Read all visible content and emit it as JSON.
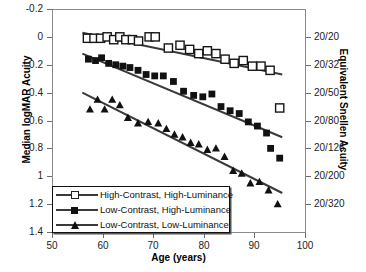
{
  "chart_data": {
    "type": "scatter",
    "title": "",
    "xlabel": "Age (years)",
    "ylabel": "Median logMAR Acuity",
    "ylabel_right": "Equivalent Snellen Acuity",
    "xlim": [
      50,
      100
    ],
    "ylim": [
      -0.2,
      1.4
    ],
    "y_inverted": true,
    "grid": false,
    "legend_position": "lower-left-inside",
    "xticks": [
      50,
      60,
      70,
      80,
      90,
      100
    ],
    "xtick_labels": [
      "50",
      "60",
      "70",
      "80",
      "90",
      "100"
    ],
    "yticks": [
      -0.2,
      0,
      0.2,
      0.4,
      0.6,
      0.8,
      1.0,
      1.2,
      1.4
    ],
    "ytick_labels": [
      "-0.2",
      "0",
      "0.2",
      "0.4",
      "0.6",
      "0.8",
      "1",
      "1.2",
      "1.4"
    ],
    "right_axis": {
      "ticks": [
        0,
        0.2,
        0.4,
        0.6,
        0.8,
        1.0,
        1.2
      ],
      "labels": [
        "20/20",
        "20/32",
        "20/50",
        "20/80",
        "20/126",
        "20/200",
        "20/320"
      ]
    },
    "series": [
      {
        "name": "High-Contrast, High-Luminance",
        "marker": "open-square",
        "color": "#111111",
        "fill": "#ffffff",
        "points": [
          [
            57.0,
            0.01
          ],
          [
            58.3,
            0.01
          ],
          [
            59.6,
            0.01
          ],
          [
            60.9,
            0.0
          ],
          [
            62.2,
            0.02
          ],
          [
            63.4,
            0.0
          ],
          [
            64.6,
            0.02
          ],
          [
            65.9,
            0.02
          ],
          [
            67.1,
            0.03
          ],
          [
            69.2,
            0.0
          ],
          [
            70.4,
            0.0
          ],
          [
            73.0,
            0.08
          ],
          [
            75.3,
            0.06
          ],
          [
            77.2,
            0.09
          ],
          [
            79.0,
            0.12
          ],
          [
            80.7,
            0.1
          ],
          [
            82.4,
            0.12
          ],
          [
            84.2,
            0.16
          ],
          [
            86.0,
            0.19
          ],
          [
            87.8,
            0.17
          ],
          [
            89.6,
            0.21
          ],
          [
            91.3,
            0.21
          ],
          [
            93.1,
            0.24
          ],
          [
            95.0,
            0.51
          ]
        ],
        "fit_line": {
          "x": [
            56.0,
            95.5
          ],
          "y": [
            -0.03,
            0.27
          ]
        }
      },
      {
        "name": "Low-Contrast, High-Luminance",
        "marker": "filled-square",
        "color": "#111111",
        "points": [
          [
            57.2,
            0.16
          ],
          [
            58.6,
            0.17
          ],
          [
            59.8,
            0.15
          ],
          [
            61.2,
            0.19
          ],
          [
            62.6,
            0.2
          ],
          [
            64.0,
            0.21
          ],
          [
            65.4,
            0.22
          ],
          [
            67.0,
            0.24
          ],
          [
            68.6,
            0.27
          ],
          [
            70.3,
            0.28
          ],
          [
            72.0,
            0.28
          ],
          [
            74.0,
            0.32
          ],
          [
            76.0,
            0.39
          ],
          [
            78.0,
            0.42
          ],
          [
            79.8,
            0.43
          ],
          [
            81.6,
            0.41
          ],
          [
            83.4,
            0.5
          ],
          [
            85.2,
            0.53
          ],
          [
            87.0,
            0.55
          ],
          [
            88.8,
            0.61
          ],
          [
            90.6,
            0.64
          ],
          [
            92.4,
            0.69
          ],
          [
            93.2,
            0.8
          ],
          [
            95.0,
            0.87
          ]
        ],
        "fit_line": {
          "x": [
            56.0,
            95.5
          ],
          "y": [
            0.12,
            0.72
          ]
        }
      },
      {
        "name": "Low-Contrast, Low-Luminance",
        "marker": "filled-triangle",
        "color": "#111111",
        "points": [
          [
            57.5,
            0.52
          ],
          [
            59.0,
            0.45
          ],
          [
            60.4,
            0.52
          ],
          [
            61.9,
            0.45
          ],
          [
            63.4,
            0.49
          ],
          [
            65.0,
            0.58
          ],
          [
            67.0,
            0.62
          ],
          [
            69.0,
            0.61
          ],
          [
            71.0,
            0.62
          ],
          [
            72.6,
            0.66
          ],
          [
            74.2,
            0.7
          ],
          [
            75.8,
            0.72
          ],
          [
            77.4,
            0.76
          ],
          [
            79.0,
            0.77
          ],
          [
            80.7,
            0.81
          ],
          [
            82.4,
            0.8
          ],
          [
            84.1,
            0.86
          ],
          [
            85.8,
            0.96
          ],
          [
            87.5,
            0.98
          ],
          [
            89.2,
            1.05
          ],
          [
            91.0,
            1.04
          ],
          [
            92.8,
            1.1
          ],
          [
            94.6,
            1.2
          ]
        ],
        "fit_line": {
          "x": [
            56.0,
            95.5
          ],
          "y": [
            0.4,
            1.12
          ]
        }
      }
    ]
  },
  "legend": {
    "items": [
      {
        "label": "High-Contrast, High-Luminance",
        "marker": "open-square"
      },
      {
        "label": "Low-Contrast, High-Luminance",
        "marker": "filled-square"
      },
      {
        "label": "Low-Contrast, Low-Luminance",
        "marker": "filled-triangle"
      }
    ]
  }
}
